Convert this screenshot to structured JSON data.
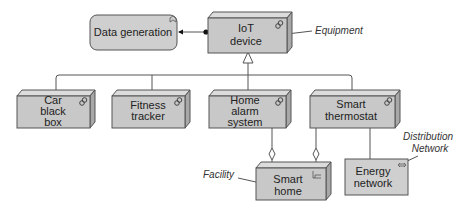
{
  "diagram": {
    "type": "ArchiMate",
    "colors": {
      "node_fill": "#c8c8c8",
      "node_top": "#dcdcdc",
      "node_side": "#a8a8a8",
      "stroke": "#555555",
      "function_fill": "#cfcfcf"
    },
    "function": {
      "label": "Data generation",
      "icon": "function-icon"
    },
    "root_device": {
      "lines": [
        "IoT",
        "device"
      ],
      "icon": "device-icon"
    },
    "devices": [
      {
        "lines": [
          "Car",
          "black",
          "box"
        ],
        "icon": "device-icon"
      },
      {
        "lines": [
          "Fitness",
          "tracker"
        ],
        "icon": "device-icon"
      },
      {
        "lines": [
          "Home",
          "alarm",
          "system"
        ],
        "icon": "device-icon"
      },
      {
        "lines": [
          "Smart",
          "thermostat"
        ],
        "icon": "device-icon"
      }
    ],
    "facility": {
      "lines": [
        "Smart",
        "home"
      ],
      "icon": "facility-icon"
    },
    "network": {
      "lines": [
        "Energy",
        "network"
      ],
      "icon": "network-icon"
    },
    "annotations": {
      "equipment": "Equipment",
      "facility": "Facility",
      "distribution_line1": "Distribution",
      "distribution_line2": "Network"
    },
    "relationships": [
      {
        "from": "IoT device",
        "to": "Data generation",
        "type": "assignment"
      },
      {
        "from": "Car black box",
        "to": "IoT device",
        "type": "specialization"
      },
      {
        "from": "Fitness tracker",
        "to": "IoT device",
        "type": "specialization"
      },
      {
        "from": "Home alarm system",
        "to": "IoT device",
        "type": "specialization"
      },
      {
        "from": "Smart thermostat",
        "to": "IoT device",
        "type": "specialization"
      },
      {
        "from": "Smart home",
        "to": "Home alarm system",
        "type": "aggregation"
      },
      {
        "from": "Smart home",
        "to": "Smart thermostat",
        "type": "aggregation"
      },
      {
        "from": "Smart thermostat",
        "to": "Energy network",
        "type": "association"
      }
    ]
  }
}
